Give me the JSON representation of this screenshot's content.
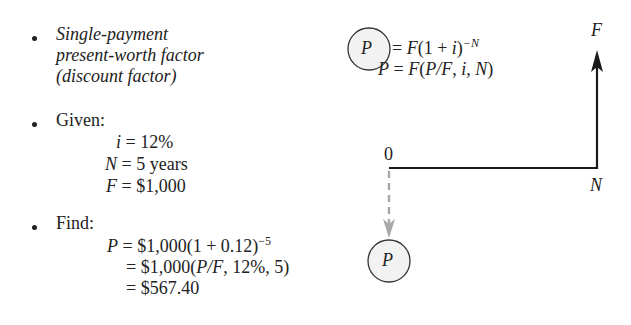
{
  "left_panel": {
    "bullet1": {
      "lines": [
        "Single-payment",
        "present-worth factor",
        "(discount factor)"
      ]
    },
    "given": {
      "label": "Given:",
      "i": {
        "var": "i",
        "eq": "= 12%"
      },
      "N": {
        "var": "N",
        "eq": "= 5 years"
      },
      "F": {
        "var": "F",
        "eq": "= $1,000"
      }
    },
    "find": {
      "label": "Find:",
      "line1": {
        "var": "P",
        "eq": "= $1,000(1 + 0.12)",
        "exp": "−5"
      },
      "line2": {
        "pre": "= $1,000(",
        "pf": "P/F",
        "post": ", 12%, 5)"
      },
      "line3": {
        "eq": "= $567.40"
      }
    }
  },
  "right_panel": {
    "formula1": {
      "circled_var": "P",
      "eq_pre": "= ",
      "F": "F",
      "mid": "(1 + ",
      "i": "i",
      "close": ")",
      "exp": "−N"
    },
    "formula2": {
      "P": "P",
      "eq": " = ",
      "F": "F",
      "open": "(",
      "pf": "P/F",
      "comma": ", ",
      "i": "i",
      "comma2": ", ",
      "N": "N",
      "close": ")"
    },
    "timeline": {
      "start_label": "0",
      "end_label": "N",
      "future_value_label": "F",
      "present_value_label": "P",
      "colors": {
        "solid": "#1a1a1a",
        "dashed": "#a8a8a8",
        "circle_fill": "#f2f2f2",
        "circle_stroke": "#333333"
      }
    }
  }
}
